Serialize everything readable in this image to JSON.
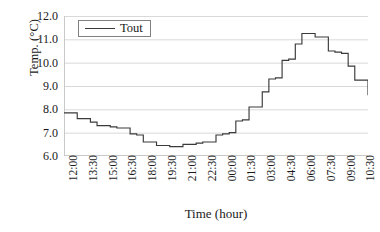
{
  "chart_data": {
    "type": "line",
    "title": "",
    "xlabel": "Time (hour)",
    "ylabel": "Temp. (°C)",
    "ylim": [
      6.0,
      12.0
    ],
    "yticks": [
      "12.0",
      "11.0",
      "10.0",
      "9.0",
      "8.0",
      "7.0",
      "6.0"
    ],
    "ytick_values": [
      12.0,
      11.0,
      10.0,
      9.0,
      8.0,
      7.0,
      6.0
    ],
    "grid": "horizontal",
    "legend": {
      "position": "top-left-inside",
      "entries": [
        {
          "name": "Tout",
          "color": "#3a3a3a",
          "style": "line"
        }
      ]
    },
    "categories": [
      "12:00",
      "13:30",
      "15:00",
      "16:30",
      "18:00",
      "19:30",
      "21:00",
      "22:30",
      "00:00",
      "01:30",
      "03:00",
      "04:30",
      "06:00",
      "07:30",
      "09:00",
      "10:30"
    ],
    "xtick_interval_hours": 1.5,
    "series": [
      {
        "name": "Tout",
        "color": "#3a3a3a",
        "x": [
          "12:00",
          "12:30",
          "13:00",
          "13:30",
          "14:00",
          "14:30",
          "15:00",
          "15:30",
          "16:00",
          "16:30",
          "17:00",
          "17:30",
          "18:00",
          "18:30",
          "19:00",
          "19:30",
          "20:00",
          "20:30",
          "21:00",
          "21:30",
          "22:00",
          "22:30",
          "23:00",
          "23:30",
          "00:00",
          "00:30",
          "01:00",
          "01:30",
          "02:00",
          "02:30",
          "03:00",
          "03:30",
          "04:00",
          "04:30",
          "05:00",
          "05:30",
          "06:00",
          "06:30",
          "07:00",
          "07:30",
          "08:00",
          "08:30",
          "09:00",
          "09:30",
          "10:00",
          "10:30",
          "11:00"
        ],
        "values": [
          7.85,
          7.85,
          7.6,
          7.6,
          7.45,
          7.3,
          7.3,
          7.25,
          7.2,
          7.2,
          6.95,
          6.9,
          6.6,
          6.6,
          6.45,
          6.45,
          6.4,
          6.4,
          6.5,
          6.5,
          6.55,
          6.6,
          6.6,
          6.9,
          6.95,
          7.0,
          7.5,
          7.55,
          8.1,
          8.1,
          8.75,
          9.3,
          9.35,
          10.1,
          10.15,
          10.8,
          11.25,
          11.25,
          11.1,
          11.1,
          10.5,
          10.45,
          10.4,
          9.85,
          9.25,
          9.25,
          8.6
        ]
      }
    ],
    "annotations": []
  },
  "figure": {
    "background": "#ffffff",
    "line_color": "#3a3a3a",
    "grid_color": "#d9d9d9",
    "axis_color": "#c9c9c9"
  }
}
